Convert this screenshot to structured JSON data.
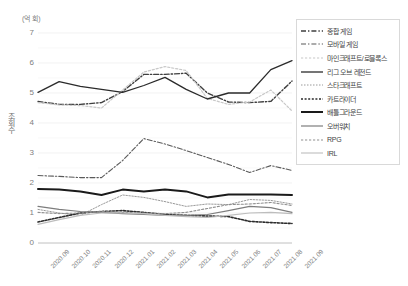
{
  "chart_data": {
    "type": "line",
    "title": "",
    "unit_label": "(억 회)",
    "ylabel": "조회수",
    "xlabel": "",
    "ylim": [
      0,
      7
    ],
    "yticks": [
      0,
      1,
      2,
      3,
      4,
      5,
      6,
      7
    ],
    "grid": true,
    "legend_position": "right",
    "categories": [
      "2020.09",
      "2020.10",
      "2020.11",
      "2020.12",
      "2021.01",
      "2021.02",
      "2021.03",
      "2021.04",
      "2021.05",
      "2021.06",
      "2021.07",
      "2021.08",
      "2021.09"
    ],
    "series": [
      {
        "name": "종합 게임",
        "color": "#3f3f3f",
        "style": "dash-dot",
        "width": 1.4,
        "values": [
          4.72,
          4.62,
          4.62,
          4.68,
          5.05,
          5.62,
          5.62,
          5.66,
          5.0,
          4.7,
          4.68,
          4.72,
          5.4
        ]
      },
      {
        "name": "모바일 게임",
        "color": "#5a5a5a",
        "style": "dash-dot",
        "width": 1.1,
        "values": [
          2.25,
          2.22,
          2.18,
          2.18,
          2.75,
          3.48,
          3.3,
          3.08,
          2.85,
          2.62,
          2.35,
          2.58,
          2.42
        ]
      },
      {
        "name": "마인크래프트/로블록스",
        "color": "#c8c8c8",
        "style": "dotted",
        "width": 1.2,
        "values": [
          4.68,
          4.6,
          4.58,
          4.5,
          5.1,
          5.7,
          5.88,
          5.75,
          4.82,
          4.62,
          4.7,
          5.1,
          4.4
        ]
      },
      {
        "name": "리그 오브 레전드",
        "color": "#2b2b2b",
        "style": "solid",
        "width": 1.3,
        "values": [
          5.02,
          5.38,
          5.22,
          5.12,
          5.02,
          5.25,
          5.52,
          5.12,
          4.8,
          5.0,
          5.0,
          5.78,
          6.08
        ]
      },
      {
        "name": "스타크래프트",
        "color": "#9a9a9a",
        "style": "fine-dotted",
        "width": 1.0,
        "values": [
          1.12,
          1.0,
          0.92,
          1.28,
          1.6,
          1.52,
          1.38,
          1.22,
          1.3,
          1.28,
          1.45,
          1.42,
          1.3
        ]
      },
      {
        "name": "카트라이더",
        "color": "#2b2b2b",
        "style": "bold-dotted",
        "width": 1.6,
        "values": [
          0.7,
          0.85,
          1.0,
          1.05,
          1.08,
          1.02,
          0.95,
          0.92,
          0.9,
          0.88,
          0.72,
          0.68,
          0.65
        ]
      },
      {
        "name": "배틀그라운드",
        "color": "#1a1a1a",
        "style": "solid",
        "width": 2.0,
        "values": [
          1.8,
          1.78,
          1.72,
          1.6,
          1.78,
          1.72,
          1.78,
          1.72,
          1.52,
          1.62,
          1.62,
          1.62,
          1.6
        ]
      },
      {
        "name": "오버워치",
        "color": "#7d7d7d",
        "style": "solid",
        "width": 1.2,
        "values": [
          1.22,
          1.12,
          1.05,
          1.02,
          0.98,
          0.95,
          0.92,
          0.92,
          0.95,
          1.08,
          1.22,
          1.18,
          1.02
        ]
      },
      {
        "name": "RPG",
        "color": "#8f8f8f",
        "style": "dotted",
        "width": 1.1,
        "values": [
          1.02,
          0.98,
          1.0,
          1.05,
          1.02,
          1.0,
          0.98,
          1.02,
          1.15,
          1.28,
          1.3,
          1.35,
          1.25
        ]
      },
      {
        "name": "IRL",
        "color": "#bdbdbd",
        "style": "solid",
        "width": 1.1,
        "values": [
          0.62,
          0.78,
          0.92,
          1.0,
          1.0,
          0.98,
          0.92,
          0.88,
          0.85,
          0.92,
          1.0,
          1.02,
          0.98
        ]
      }
    ]
  }
}
